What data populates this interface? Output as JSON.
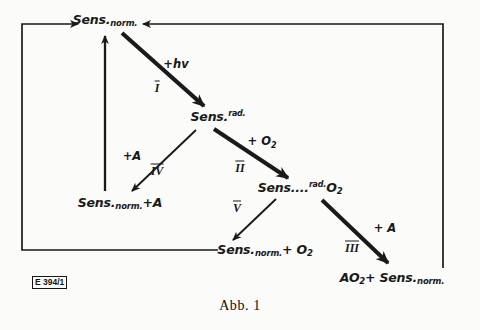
{
  "figure": {
    "caption": "Abb. 1",
    "corner_tag": "E 394/1",
    "background_color": "#fbfbfa",
    "ink_color": "#1a1a1a"
  },
  "nodes": [
    {
      "id": "sens-norm-top",
      "base": "Sens.",
      "sub": "norm.",
      "full_text": "Sens.norm.",
      "x": 105,
      "y": 20
    },
    {
      "id": "sens-rad",
      "base": "Sens.",
      "sup": "rad.",
      "full_text": "Sens.rad.",
      "x": 218,
      "y": 116
    },
    {
      "id": "sens-norm-plus-a",
      "base": "Sens.",
      "sub": "norm.",
      "tail": "+A",
      "full_text": "Sens.norm.+A",
      "x": 120,
      "y": 203
    },
    {
      "id": "sens-rad-o2",
      "base": "Sens....",
      "sup": "rad.",
      "tail": "O",
      "tail_sub": "2",
      "full_text": "Sens....rad. O2",
      "x": 300,
      "y": 188
    },
    {
      "id": "sens-norm-plus-o2",
      "base": "Sens.",
      "sub": "norm.",
      "tail": "+ O",
      "tail_sub": "2",
      "full_text": "Sens.norm.+ O2",
      "x": 265,
      "y": 250
    },
    {
      "id": "ao2-plus-sens-norm",
      "base": "AO",
      "base_sub": "2",
      "tail": "+ Sens.",
      "tail_sub2": "norm.",
      "full_text": "AO2 + Sens.norm.",
      "x": 392,
      "y": 278
    }
  ],
  "edge_labels": [
    {
      "id": "label-hv",
      "text": "+hv",
      "x": 176,
      "y": 64
    },
    {
      "id": "label-o2",
      "text": "+ O",
      "sub": "2",
      "x": 262,
      "y": 142
    },
    {
      "id": "label-a-iv",
      "text": "+A",
      "x": 132,
      "y": 156
    },
    {
      "id": "label-a-iii",
      "text": "+ A",
      "x": 385,
      "y": 228
    }
  ],
  "step_numbers": [
    {
      "id": "step-I",
      "text": "I",
      "x": 157,
      "y": 88
    },
    {
      "id": "step-II",
      "text": "II",
      "x": 240,
      "y": 168
    },
    {
      "id": "step-III",
      "text": "III",
      "x": 352,
      "y": 248
    },
    {
      "id": "step-IV",
      "text": "IV",
      "x": 157,
      "y": 171
    },
    {
      "id": "step-V",
      "text": "V",
      "x": 237,
      "y": 208
    }
  ],
  "edges": [
    {
      "id": "edge-I",
      "from": "sens-norm-top",
      "to": "sens-rad",
      "step": "I",
      "reagent": "+hv",
      "style": "thick-arrow"
    },
    {
      "id": "edge-II",
      "from": "sens-rad",
      "to": "sens-rad-o2",
      "step": "II",
      "reagent": "+ O2",
      "style": "thick-arrow"
    },
    {
      "id": "edge-III",
      "from": "sens-rad-o2",
      "to": "ao2-plus-sens-norm",
      "step": "III",
      "reagent": "+ A",
      "style": "thick-arrow"
    },
    {
      "id": "edge-IV",
      "from": "sens-rad",
      "to": "sens-norm-plus-a",
      "step": "IV",
      "reagent": "+A",
      "style": "thin-arrow"
    },
    {
      "id": "edge-V",
      "from": "sens-rad-o2",
      "to": "sens-norm-plus-o2",
      "step": "V",
      "reagent": "",
      "style": "thin-arrow"
    },
    {
      "id": "edge-regen-left",
      "from": "sens-norm-plus-a",
      "to": "sens-norm-top",
      "step": "",
      "reagent": "",
      "style": "thin-arrow-vertical"
    },
    {
      "id": "edge-return-left",
      "from": "sens-norm-plus-o2",
      "to": "sens-norm-top",
      "step": "",
      "reagent": "",
      "style": "orthogonal-loop"
    },
    {
      "id": "edge-return-right",
      "from": "ao2-plus-sens-norm",
      "to": "sens-norm-top",
      "step": "",
      "reagent": "",
      "style": "orthogonal-loop"
    }
  ]
}
